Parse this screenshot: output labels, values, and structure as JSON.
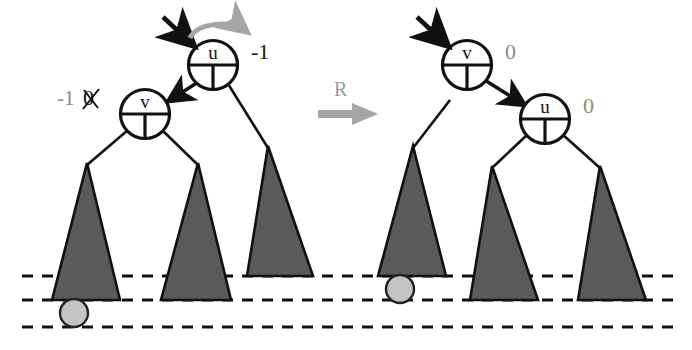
{
  "figure": {
    "type": "binary-tree-rotation-diagram"
  },
  "colors": {
    "triangle_fill": "#5a5a5a",
    "triangle_stroke": "#111111",
    "ball_fill": "#c4c4c4",
    "ball_stroke": "#222222",
    "gray_arrow": "#a6a6a6",
    "black": "#111111",
    "gray_text": "#8a8a8a",
    "dashed_line": "#111111"
  },
  "left_tree": {
    "caption": "before rotation",
    "root": {
      "name": "root-node-u",
      "letter": "u",
      "balance_label": "-1",
      "balance_color": "#111111",
      "incoming_arrow": "black-arrow-into-u",
      "rotation_arrow": "gray-curved-arrow-clockwise"
    },
    "child": {
      "name": "child-node-v",
      "letter": "v",
      "balance_old": "0",
      "balance_new": "-1",
      "balance_note": "old value struck through",
      "balance_color": "#8a8a8a"
    },
    "subtrees": [
      {
        "name": "subtree-left-of-v",
        "depth_line": 2
      },
      {
        "name": "subtree-right-of-v",
        "depth_line": 2
      },
      {
        "name": "subtree-right-of-u",
        "depth_line": 1
      }
    ],
    "marker": {
      "name": "inserted-node-ball",
      "position": "below-left-subtree"
    }
  },
  "transform": {
    "name": "rotation-arrow",
    "label": "R",
    "direction": "right"
  },
  "right_tree": {
    "caption": "after rotation",
    "root": {
      "name": "root-node-v",
      "letter": "v",
      "balance_label": "0",
      "balance_color": "#8a8a8a",
      "incoming_arrow": "black-arrow-into-v"
    },
    "child": {
      "name": "child-node-u",
      "letter": "u",
      "balance_label": "0",
      "balance_color": "#8a8a8a"
    },
    "subtrees": [
      {
        "name": "subtree-left-of-v",
        "depth_line": 1
      },
      {
        "name": "subtree-left-of-u",
        "depth_line": 2
      },
      {
        "name": "subtree-right-of-u",
        "depth_line": 2
      }
    ],
    "marker": {
      "name": "inserted-node-ball",
      "position": "below-left-subtree"
    }
  },
  "depth_lines": [
    {
      "name": "depth-line-1",
      "y": 276
    },
    {
      "name": "depth-line-2",
      "y": 300
    },
    {
      "name": "depth-line-3",
      "y": 327
    }
  ]
}
